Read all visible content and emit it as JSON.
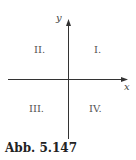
{
  "diagram": {
    "axes": {
      "x_label": "x",
      "y_label": "y"
    },
    "quadrants": {
      "q1": "I.",
      "q2": "II.",
      "q3": "III.",
      "q4": "IV."
    },
    "caption": "Abb. 5.147"
  }
}
